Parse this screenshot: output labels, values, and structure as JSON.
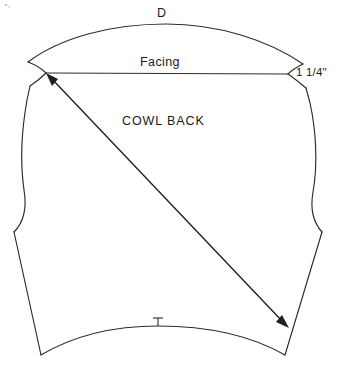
{
  "page": {
    "background_color": "#ffffff",
    "line_color": "#2b2b2b",
    "width": 343,
    "height": 371
  },
  "labels": {
    "top_marker": "D",
    "facing": "Facing",
    "piece_name": "COWL BACK",
    "measurement": "1 1/4\""
  },
  "annotations": {
    "grainline_arrow_name": "bias-grainline-arrow",
    "hem_notch_name": "center-back-notch",
    "top_curve_name": "cowl-top-edge",
    "facing_line_name": "facing-fold-line"
  },
  "geometry": {
    "left_shoulder_point": [
      46,
      73
    ],
    "right_shoulder_point": [
      288,
      74
    ],
    "bottom_left_corner": [
      41,
      355
    ],
    "bottom_right_corner": [
      285,
      355
    ],
    "left_waist_notch": [
      14,
      232
    ],
    "right_waist_notch": [
      322,
      232
    ],
    "hem_notch": [
      158,
      326
    ],
    "arrow_start": [
      288,
      327
    ],
    "arrow_end": [
      47,
      75
    ]
  }
}
